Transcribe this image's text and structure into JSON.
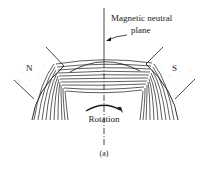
{
  "figure": {
    "labels": {
      "neutral_plane_line1": "Magnetic neutral",
      "neutral_plane_line2": "plane",
      "north_pole": "N",
      "south_pole": "S",
      "rotation": "Rotation",
      "caption": "(a)"
    },
    "colors": {
      "ink": "#1a1a1a",
      "background": "#ffffff",
      "stipple": "#c8c8c8"
    }
  }
}
